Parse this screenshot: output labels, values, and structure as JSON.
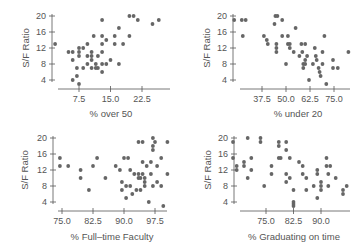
{
  "chart_data": [
    {
      "type": "scatter",
      "title": "",
      "xlabel": "% over 50",
      "ylabel": "S/F Ratio",
      "xticks": [
        "7.5",
        "15.0",
        "22.5"
      ],
      "yticks": [
        "4",
        "8",
        "12",
        "16",
        "20"
      ],
      "xlim": [
        1.5,
        26.5
      ],
      "ylim": [
        2,
        21
      ],
      "grid": false,
      "points": [
        [
          1.8,
          13
        ],
        [
          5,
          11
        ],
        [
          6,
          11
        ],
        [
          6,
          9
        ],
        [
          6,
          4
        ],
        [
          7,
          5
        ],
        [
          7,
          7
        ],
        [
          7.5,
          3
        ],
        [
          7.5,
          10
        ],
        [
          7.5,
          11
        ],
        [
          7.5,
          12
        ],
        [
          8.5,
          7
        ],
        [
          8.5,
          12
        ],
        [
          9.5,
          8
        ],
        [
          9.5,
          10
        ],
        [
          9.5,
          13
        ],
        [
          10.5,
          7
        ],
        [
          10.5,
          9
        ],
        [
          10.5,
          10
        ],
        [
          10.5,
          11
        ],
        [
          11,
          15
        ],
        [
          11.5,
          7
        ],
        [
          11.5,
          8
        ],
        [
          12,
          7
        ],
        [
          12,
          10
        ],
        [
          13,
          6
        ],
        [
          13,
          8
        ],
        [
          13,
          11
        ],
        [
          13,
          13
        ],
        [
          13,
          15
        ],
        [
          13,
          19
        ],
        [
          14,
          8
        ],
        [
          14,
          14
        ],
        [
          15,
          9
        ],
        [
          16,
          13
        ],
        [
          16,
          15
        ],
        [
          17,
          8
        ],
        [
          17,
          17
        ],
        [
          18,
          13
        ],
        [
          19.5,
          15
        ],
        [
          19.5,
          20
        ],
        [
          20.5,
          20
        ],
        [
          21.5,
          19
        ],
        [
          25,
          18
        ],
        [
          26.5,
          19
        ]
      ]
    },
    {
      "type": "scatter",
      "title": "",
      "xlabel": "% under 20",
      "ylabel": "S/F Ratio",
      "xticks": [
        "37.5",
        "50.0",
        "62.5",
        "75.0"
      ],
      "yticks": [
        "4",
        "8",
        "12",
        "16",
        "20"
      ],
      "xlim": [
        22,
        83
      ],
      "ylim": [
        2,
        21
      ],
      "grid": false,
      "points": [
        [
          23,
          19
        ],
        [
          27,
          19
        ],
        [
          29,
          19
        ],
        [
          27.5,
          15
        ],
        [
          38.5,
          15
        ],
        [
          40,
          14
        ],
        [
          40.5,
          13
        ],
        [
          44,
          18
        ],
        [
          44.5,
          20
        ],
        [
          45.5,
          20
        ],
        [
          45,
          13
        ],
        [
          45,
          12
        ],
        [
          45,
          11
        ],
        [
          48,
          19
        ],
        [
          48,
          15
        ],
        [
          50,
          8
        ],
        [
          51,
          15
        ],
        [
          51,
          13
        ],
        [
          52,
          13
        ],
        [
          52,
          12
        ],
        [
          54,
          11
        ],
        [
          55,
          17
        ],
        [
          57,
          10
        ],
        [
          58.5,
          11
        ],
        [
          58,
          13
        ],
        [
          59,
          8
        ],
        [
          59,
          7
        ],
        [
          60,
          13
        ],
        [
          60,
          9
        ],
        [
          60,
          8
        ],
        [
          61,
          10
        ],
        [
          62,
          4
        ],
        [
          64,
          8
        ],
        [
          65,
          12
        ],
        [
          65.5,
          10
        ],
        [
          66,
          9
        ],
        [
          67,
          7
        ],
        [
          67.5,
          6
        ],
        [
          68,
          5
        ],
        [
          69,
          11
        ],
        [
          69,
          8
        ],
        [
          70,
          15
        ],
        [
          71,
          3
        ],
        [
          74.5,
          9
        ],
        [
          74.5,
          7
        ],
        [
          77,
          7
        ],
        [
          82.5,
          11
        ]
      ]
    },
    {
      "type": "scatter",
      "title": "",
      "xlabel": "% Full–time Faculty",
      "ylabel": "S/F Ratio",
      "xticks": [
        "75.0",
        "82.5",
        "90.0",
        "97.5"
      ],
      "yticks": [
        "4",
        "8",
        "12",
        "16",
        "20"
      ],
      "xlim": [
        72.5,
        100.5
      ],
      "ylim": [
        2,
        21
      ],
      "grid": false,
      "points": [
        [
          74.5,
          15
        ],
        [
          74.5,
          13
        ],
        [
          76.5,
          13
        ],
        [
          79.5,
          12
        ],
        [
          79.5,
          10
        ],
        [
          81.5,
          7
        ],
        [
          82.5,
          13
        ],
        [
          83.5,
          15
        ],
        [
          85.5,
          10
        ],
        [
          88,
          13
        ],
        [
          89,
          12
        ],
        [
          89.5,
          9
        ],
        [
          89.5,
          7
        ],
        [
          90,
          15
        ],
        [
          90.5,
          8
        ],
        [
          90.5,
          5
        ],
        [
          91,
          15
        ],
        [
          91.5,
          12
        ],
        [
          91.5,
          8
        ],
        [
          92,
          6
        ],
        [
          92.5,
          11
        ],
        [
          93,
          7
        ],
        [
          93.5,
          11
        ],
        [
          93.5,
          10
        ],
        [
          93.5,
          19
        ],
        [
          94,
          10
        ],
        [
          94,
          7
        ],
        [
          94.5,
          19
        ],
        [
          94.5,
          14
        ],
        [
          94.5,
          11
        ],
        [
          95,
          10
        ],
        [
          95,
          9
        ],
        [
          95,
          8
        ],
        [
          95.5,
          13
        ],
        [
          96,
          4
        ],
        [
          96.5,
          14
        ],
        [
          96.5,
          11
        ],
        [
          97,
          20
        ],
        [
          97,
          18
        ],
        [
          97,
          17
        ],
        [
          97,
          8
        ],
        [
          97.5,
          19
        ],
        [
          98,
          13
        ],
        [
          98,
          9
        ],
        [
          99,
          15
        ],
        [
          99,
          8
        ],
        [
          99.5,
          3
        ],
        [
          100.5,
          19
        ],
        [
          100.5,
          11
        ]
      ]
    },
    {
      "type": "scatter",
      "title": "",
      "xlabel": "% Graduating on time",
      "ylabel": "S/F Ratio",
      "xticks": [
        "75.0",
        "82.5",
        "90.0"
      ],
      "yticks": [
        "4",
        "8",
        "12",
        "16",
        "20"
      ],
      "xlim": [
        65.5,
        97
      ],
      "ylim": [
        2,
        21
      ],
      "grid": false,
      "points": [
        [
          66,
          19
        ],
        [
          66,
          15
        ],
        [
          67,
          13
        ],
        [
          67,
          12
        ],
        [
          69,
          14
        ],
        [
          69,
          13
        ],
        [
          70,
          20
        ],
        [
          70,
          10
        ],
        [
          71,
          15
        ],
        [
          71,
          12
        ],
        [
          73.5,
          20
        ],
        [
          73.5,
          19
        ],
        [
          74.5,
          8
        ],
        [
          76.5,
          13
        ],
        [
          76.5,
          11
        ],
        [
          78.5,
          19
        ],
        [
          78.5,
          18
        ],
        [
          78.5,
          15
        ],
        [
          79,
          15
        ],
        [
          80.5,
          19
        ],
        [
          80.5,
          17
        ],
        [
          80.5,
          11
        ],
        [
          80.5,
          9
        ],
        [
          81.5,
          15
        ],
        [
          81.5,
          10
        ],
        [
          82.5,
          7
        ],
        [
          82.5,
          4
        ],
        [
          82.5,
          3.5
        ],
        [
          82.5,
          3
        ],
        [
          84,
          14
        ],
        [
          85,
          13
        ],
        [
          85,
          11
        ],
        [
          86,
          10
        ],
        [
          86,
          7
        ],
        [
          88,
          8
        ],
        [
          89,
          12
        ],
        [
          89,
          11
        ],
        [
          89,
          5
        ],
        [
          90,
          9
        ],
        [
          90,
          8
        ],
        [
          90,
          7
        ],
        [
          91.5,
          15
        ],
        [
          91.5,
          13
        ],
        [
          92,
          11
        ],
        [
          92,
          8
        ],
        [
          92.5,
          13
        ],
        [
          94,
          10
        ],
        [
          96,
          7
        ],
        [
          96,
          6
        ],
        [
          97,
          8
        ]
      ]
    }
  ],
  "panels": [
    {
      "ylabel": "S/F Ratio",
      "xlabel": "% over 50"
    },
    {
      "ylabel": "S/F Ratio",
      "xlabel": "% under 20"
    },
    {
      "ylabel": "S/F Ratio",
      "xlabel": "% Full–time Faculty"
    },
    {
      "ylabel": "S/F Ratio",
      "xlabel": "% Graduating on time"
    }
  ],
  "colors": {
    "point": "#666666",
    "axis": "#555555",
    "text": "#555555"
  }
}
